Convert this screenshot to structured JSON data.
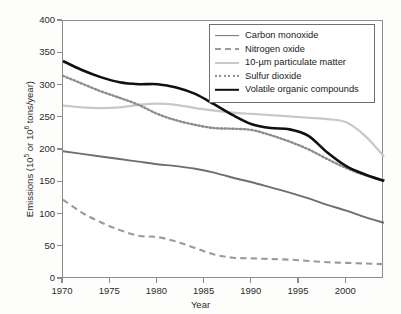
{
  "figure": {
    "background": "#fdfdfc",
    "frame_color": "#8b8b8b"
  },
  "chart_data": {
    "type": "line",
    "title": "",
    "subtitle": "",
    "xlabel": "Year",
    "ylabel": "Emissions (10^5 or 10^6 tons/year)",
    "ylabel_parts": {
      "prefix": "Emissions (10",
      "sup1": "5",
      "middle": " or 10",
      "sup2": "6",
      "suffix": " tons/year)"
    },
    "xlim": [
      1970,
      2004
    ],
    "ylim": [
      0,
      400
    ],
    "grid": false,
    "legend_position": "upper right",
    "y_ticks": [
      0,
      50,
      100,
      150,
      200,
      250,
      300,
      350,
      400
    ],
    "y_tick_labels": [
      "0",
      "50",
      "100",
      "150",
      "200",
      "250",
      "300",
      "350",
      "400"
    ],
    "x_ticks": [
      1970,
      1975,
      1980,
      1985,
      1990,
      1995,
      2000
    ],
    "x_tick_labels": [
      "1970",
      "1975",
      "1980",
      "1985",
      "1990",
      "1995",
      "2000"
    ],
    "x": [
      1970,
      1972,
      1974,
      1976,
      1978,
      1980,
      1982,
      1984,
      1986,
      1988,
      1990,
      1992,
      1994,
      1996,
      1998,
      2000,
      2002,
      2004
    ],
    "series": [
      {
        "name": "Carbon monoxide",
        "color": "#6e6e6e",
        "style": "solid",
        "width": 1.9,
        "values": [
          198,
          194,
          190,
          186,
          182,
          178,
          175,
          171,
          165,
          157,
          150,
          142,
          134,
          125,
          115,
          106,
          96,
          87
        ]
      },
      {
        "name": "Nitrogen oxide",
        "color": "#9a9a9a",
        "style": "dashed",
        "width": 2.1,
        "values": [
          123,
          103,
          88,
          76,
          67,
          65,
          58,
          48,
          38,
          33,
          32,
          31,
          30,
          28,
          26,
          25,
          24,
          23
        ]
      },
      {
        "name": "10-µm particulate matter",
        "color": "#c8c8c8",
        "style": "solid",
        "width": 2.2,
        "values": [
          269,
          266,
          265,
          266,
          270,
          272,
          270,
          265,
          261,
          258,
          256,
          254,
          252,
          250,
          248,
          243,
          222,
          190
        ]
      },
      {
        "name": "Sulfur dioxide",
        "color": "#8c8c8c",
        "style": "dotted",
        "width": 2.4,
        "values": [
          315,
          303,
          291,
          281,
          270,
          256,
          246,
          239,
          234,
          233,
          231,
          223,
          213,
          201,
          186,
          172,
          161,
          153
        ]
      },
      {
        "name": "Volatile organic compounds",
        "color": "#101010",
        "style": "solid",
        "width": 2.6,
        "values": [
          338,
          324,
          313,
          305,
          302,
          302,
          297,
          287,
          271,
          254,
          240,
          234,
          232,
          222,
          196,
          175,
          162,
          152
        ]
      }
    ]
  },
  "legend": {
    "items": [
      {
        "label": "Carbon monoxide"
      },
      {
        "label": "Nitrogen oxide"
      },
      {
        "label": "10-µm particulate matter"
      },
      {
        "label": "Sulfur dioxide"
      },
      {
        "label": "Volatile organic compounds"
      }
    ]
  }
}
